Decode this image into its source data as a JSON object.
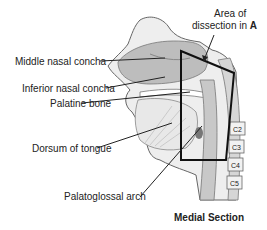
{
  "figure": {
    "caption": "Medial Section",
    "callout": {
      "line1": "Area of",
      "line2_prefix": "dissection in ",
      "line2_bold": "A"
    },
    "labels": [
      {
        "id": "middle-nasal-concha",
        "text": "Middle nasal concha"
      },
      {
        "id": "inferior-nasal-concha",
        "text": "Inferior nasal concha"
      },
      {
        "id": "palatine-bone",
        "text": "Palatine bone"
      },
      {
        "id": "dorsum-of-tongue",
        "text": "Dorsum of tongue"
      },
      {
        "id": "palatoglossal-arch",
        "text": "Palatoglossal arch"
      }
    ],
    "vertebrae": [
      "C2",
      "C3",
      "C4",
      "C5"
    ]
  }
}
